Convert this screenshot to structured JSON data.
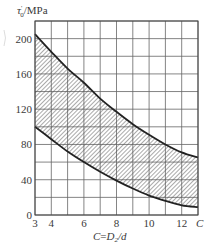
{
  "chart_data": {
    "type": "area",
    "title": "",
    "ylabel": "τ'0/MPa",
    "ylabel_main": "τ",
    "ylabel_sup": "'",
    "ylabel_sub": "0",
    "ylabel_unit": "/MPa",
    "xlabel": "C=D2/d",
    "xlabel_parts": {
      "a": "C",
      "eq": "=",
      "b": "D",
      "sub": "2",
      "c": "/d"
    },
    "x_end_label": "C",
    "xlim": [
      3,
      13
    ],
    "ylim": [
      0,
      220
    ],
    "x_ticks": [
      3,
      4,
      6,
      8,
      10,
      12
    ],
    "x_tick_labels": [
      "3",
      "4",
      "6",
      "8",
      "10",
      "12"
    ],
    "y_ticks": [
      0,
      40,
      80,
      120,
      160,
      200
    ],
    "y_tick_labels": [
      "0",
      "40",
      "80",
      "120",
      "160",
      "200"
    ],
    "grid": {
      "on": true,
      "x_step": 1,
      "y_step": 20
    },
    "legend": null,
    "fill": "hatched region between upper and lower curves",
    "series": [
      {
        "name": "upper bound",
        "x": [
          3,
          4,
          5,
          6,
          7,
          8,
          9,
          10,
          11,
          12,
          13
        ],
        "values": [
          205,
          185,
          166,
          150,
          132,
          117,
          103,
          91,
          80,
          71,
          65
        ]
      },
      {
        "name": "lower bound",
        "x": [
          3,
          4,
          5,
          6,
          7,
          8,
          9,
          10,
          11,
          12,
          13
        ],
        "values": [
          100,
          86,
          72,
          60,
          49,
          39,
          30,
          22,
          16,
          11,
          9
        ]
      }
    ]
  }
}
